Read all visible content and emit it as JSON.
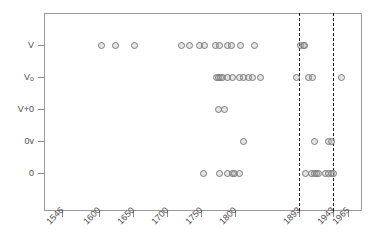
{
  "chart_data": {
    "type": "scatter",
    "title": "",
    "subtitle": "",
    "xlabel": "",
    "ylabel": "",
    "grid": false,
    "legend": null,
    "xlim": [
      1520,
      1985
    ],
    "x_ticks": [
      1546,
      1600,
      1650,
      1700,
      1750,
      1800,
      1893,
      1943,
      1965
    ],
    "x_tick_labels": [
      "1546",
      "1600",
      "1650",
      "1700",
      "1750",
      "1800",
      "1893",
      "1943",
      "1965"
    ],
    "y_categories": [
      "V",
      "Vo",
      "V+0",
      "0v",
      "0"
    ],
    "y_tick_labels": [
      "V",
      "Vo",
      "V+0",
      "0v",
      "0"
    ],
    "annotations": [
      {
        "type": "vline",
        "x": 1893,
        "style": "dashed",
        "color": "#1a1a1a"
      },
      {
        "type": "vline",
        "x": 1943,
        "style": "dashed",
        "color": "#1a1a1a"
      }
    ],
    "marker": {
      "shape": "circle",
      "color": "#7a7a7a",
      "fill": "rgba(170,170,170,0.30)",
      "size": 7
    },
    "series": [
      {
        "name": "V",
        "category": "V",
        "values": [
          1604,
          1625,
          1652,
          1721,
          1733,
          1748,
          1755,
          1771,
          1777,
          1788,
          1794,
          1808,
          1828,
          1895,
          1899,
          1901
        ]
      },
      {
        "name": "Vo",
        "category": "Vo",
        "values": [
          1772,
          1775,
          1778,
          1781,
          1788,
          1795,
          1806,
          1812,
          1819,
          1825,
          1836,
          1889,
          1907,
          1913,
          1955
        ]
      },
      {
        "name": "V+0",
        "category": "V+0",
        "values": [
          1775,
          1784
        ]
      },
      {
        "name": "0v",
        "category": "0v",
        "values": [
          1811,
          1916,
          1936,
          1940
        ]
      },
      {
        "name": "0",
        "category": "0",
        "values": [
          1753,
          1776,
          1788,
          1795,
          1798,
          1806,
          1903,
          1911,
          1915,
          1918,
          1921,
          1931,
          1936,
          1940,
          1943
        ]
      }
    ]
  }
}
